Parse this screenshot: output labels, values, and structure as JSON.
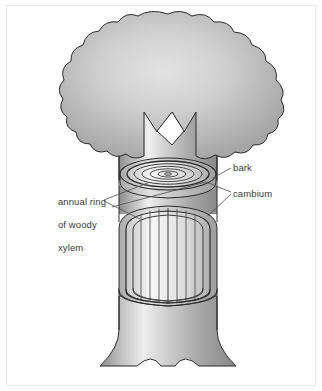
{
  "page": {
    "background_color": "#ffffff",
    "frame_color": "#e9e9e9"
  },
  "diagram": {
    "label_color": "#3b3b3b",
    "outline_color": "#2b2b2b",
    "leader_line_color": "#555555",
    "canopy": {
      "name": "tree-canopy",
      "fill_light": "#dcdcdc",
      "fill_mid": "#c0c0c0",
      "fill_dark": "#9a9a9a"
    },
    "trunk": {
      "name": "tree-trunk",
      "fill_light": "#eeeeee",
      "fill_mid": "#b8b8b8",
      "fill_dark": "#8d8d8d"
    },
    "rings_count": 5
  },
  "labels": {
    "bark": "bark",
    "cambium": "cambium",
    "annual_ring_line1": "annual ring",
    "annual_ring_line2": "of woody",
    "annual_ring_line3": "xylem"
  }
}
